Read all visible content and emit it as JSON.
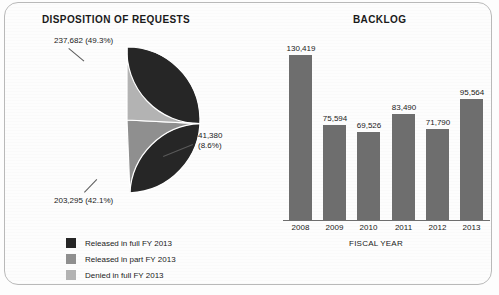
{
  "figure": {
    "background_color": "#fdfdfd",
    "border_color": "#b9b9b9"
  },
  "pie_panel": {
    "title": "DISPOSITION OF REQUESTS",
    "labels": {
      "released_full": "237,682 (49.3%)",
      "released_part_line1": "41,380",
      "released_part_line2": "(8.6%)",
      "denied_full": "203,295 (42.1%)"
    },
    "legend": [
      {
        "label": "Released in full FY 2013",
        "color": "#262626"
      },
      {
        "label": "Released in part FY 2013",
        "color": "#8f8f8f"
      },
      {
        "label": "Denied in full FY 2013",
        "color": "#b3b3b3"
      }
    ]
  },
  "bar_panel": {
    "title": "BACKLOG"
  },
  "chart_data": [
    {
      "type": "pie",
      "title": "DISPOSITION OF REQUESTS",
      "categories": [
        "Released in full FY 2013",
        "Released in part FY 2013",
        "Denied in full FY 2013"
      ],
      "values": [
        237682,
        41380,
        203295
      ],
      "percents": [
        49.3,
        8.6,
        42.1
      ],
      "value_labels": [
        "237,682 (49.3%)",
        "41,380 (8.6%)",
        "203,295 (42.1%)"
      ],
      "colors": [
        "#262626",
        "#8f8f8f",
        "#b3b3b3"
      ],
      "legend_position": "bottom-left",
      "start_angle_deg": 0,
      "direction": "clockwise"
    },
    {
      "type": "bar",
      "title": "BACKLOG",
      "categories": [
        "2008",
        "2009",
        "2010",
        "2011",
        "2012",
        "2013"
      ],
      "values": [
        130419,
        75594,
        69526,
        83490,
        71790,
        95564
      ],
      "value_labels": [
        "130,419",
        "75,594",
        "69,526",
        "83,490",
        "71,790",
        "95,564"
      ],
      "xlabel": "FISCAL YEAR",
      "ylabel": "",
      "ylim": [
        0,
        145000
      ],
      "grid": false,
      "bar_color": "#6e6e6e"
    }
  ]
}
